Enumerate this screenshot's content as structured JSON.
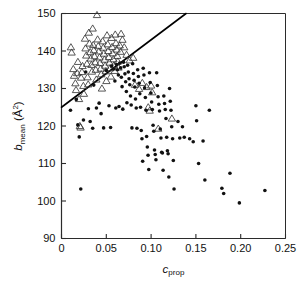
{
  "figure": {
    "background_color": "#ffffff",
    "foreground_color": "#000000"
  },
  "axes": {
    "x_title_main": "c",
    "x_title_sub": "prop",
    "y_title_main": "b",
    "y_title_sub": "mean",
    "y_title_unit_open": " (Å",
    "y_title_unit_sup": "2",
    "y_title_unit_close": ")",
    "x_ticklabels": [
      "0",
      "0.05",
      "0.10",
      "0.15",
      "0.20",
      "0.25"
    ],
    "y_ticklabels": [
      "90",
      "100",
      "110",
      "120",
      "130",
      "140",
      "150"
    ]
  },
  "chart_data": {
    "type": "scatter",
    "title": "",
    "xlabel": "c_prop",
    "ylabel": "b_mean (Å^2)",
    "xlim": [
      0,
      0.25
    ],
    "ylim": [
      90,
      150
    ],
    "xticks": [
      0,
      0.05,
      0.1,
      0.15,
      0.2,
      0.25
    ],
    "yticks": [
      90,
      100,
      110,
      120,
      130,
      140,
      150
    ],
    "grid": false,
    "legend": "none",
    "annotations": [],
    "trendline": {
      "name": "diagonal reference line",
      "x": [
        0.0,
        0.139
      ],
      "y": [
        125.0,
        150.0
      ],
      "color": "#000000",
      "width": 1.6
    },
    "series": [
      {
        "name": "open triangles",
        "marker": "triangle-up-open",
        "color": "#3a3a3a",
        "size": 4.6,
        "points": [
          [
            0.0105,
            141.0
          ],
          [
            0.0113,
            139.6
          ],
          [
            0.0132,
            135.2
          ],
          [
            0.014,
            133.4
          ],
          [
            0.0155,
            131.4
          ],
          [
            0.0162,
            129.6
          ],
          [
            0.0175,
            134.1
          ],
          [
            0.0183,
            137.1
          ],
          [
            0.0196,
            127.2
          ],
          [
            0.0205,
            120.0
          ],
          [
            0.0213,
            119.6
          ],
          [
            0.0219,
            132.9
          ],
          [
            0.0228,
            134.4
          ],
          [
            0.0235,
            136.0
          ],
          [
            0.0244,
            130.7
          ],
          [
            0.025,
            128.6
          ],
          [
            0.0262,
            143.3
          ],
          [
            0.0268,
            140.7
          ],
          [
            0.0276,
            138.8
          ],
          [
            0.0284,
            136.6
          ],
          [
            0.0291,
            133.0
          ],
          [
            0.0298,
            131.1
          ],
          [
            0.0305,
            144.9
          ],
          [
            0.0312,
            142.0
          ],
          [
            0.032,
            139.7
          ],
          [
            0.0327,
            138.0
          ],
          [
            0.0334,
            136.3
          ],
          [
            0.034,
            134.5
          ],
          [
            0.0348,
            146.0
          ],
          [
            0.0354,
            141.6
          ],
          [
            0.0361,
            140.2
          ],
          [
            0.0368,
            138.6
          ],
          [
            0.0376,
            137.0
          ],
          [
            0.0382,
            135.0
          ],
          [
            0.0389,
            132.4
          ],
          [
            0.0396,
            149.6
          ],
          [
            0.0403,
            143.1
          ],
          [
            0.041,
            141.3
          ],
          [
            0.0417,
            139.9
          ],
          [
            0.0424,
            138.3
          ],
          [
            0.043,
            136.8
          ],
          [
            0.0437,
            135.3
          ],
          [
            0.0444,
            133.8
          ],
          [
            0.0451,
            130.0
          ],
          [
            0.0459,
            142.6
          ],
          [
            0.0466,
            140.9
          ],
          [
            0.0472,
            139.3
          ],
          [
            0.048,
            137.7
          ],
          [
            0.0487,
            136.1
          ],
          [
            0.0494,
            134.6
          ],
          [
            0.0501,
            132.0
          ],
          [
            0.0508,
            144.2
          ],
          [
            0.0516,
            141.8
          ],
          [
            0.0522,
            140.0
          ],
          [
            0.0529,
            138.4
          ],
          [
            0.0536,
            136.9
          ],
          [
            0.0543,
            135.4
          ],
          [
            0.0551,
            133.2
          ],
          [
            0.0558,
            143.5
          ],
          [
            0.0565,
            141.1
          ],
          [
            0.0572,
            139.4
          ],
          [
            0.0579,
            137.8
          ],
          [
            0.0586,
            136.2
          ],
          [
            0.0594,
            134.7
          ],
          [
            0.06,
            144.4
          ],
          [
            0.0608,
            142.1
          ],
          [
            0.0615,
            140.4
          ],
          [
            0.0622,
            138.7
          ],
          [
            0.0629,
            137.2
          ],
          [
            0.0636,
            135.6
          ],
          [
            0.065,
            141.5
          ],
          [
            0.0658,
            139.8
          ],
          [
            0.0665,
            144.6
          ],
          [
            0.068,
            143.0
          ],
          [
            0.07,
            141.0
          ],
          [
            0.0726,
            139.0
          ],
          [
            0.076,
            137.5
          ],
          [
            0.08,
            138.2
          ],
          [
            0.082,
            131.0
          ],
          [
            0.0866,
            129.9
          ],
          [
            0.0902,
            131.5
          ],
          [
            0.095,
            130.4
          ],
          [
            0.0968,
            125.0
          ],
          [
            0.0984,
            124.1
          ],
          [
            0.1,
            130.8
          ],
          [
            0.1012,
            129.0
          ],
          [
            0.108,
            119.3
          ],
          [
            0.1232,
            122.0
          ]
        ]
      },
      {
        "name": "filled circles",
        "marker": "circle-filled",
        "color": "#111111",
        "size": 3.6,
        "points": [
          [
            0.01,
            124.2
          ],
          [
            0.0165,
            127.1
          ],
          [
            0.0182,
            120.3
          ],
          [
            0.0198,
            117.1
          ],
          [
            0.0215,
            103.2
          ],
          [
            0.0245,
            121.6
          ],
          [
            0.027,
            134.4
          ],
          [
            0.03,
            124.6
          ],
          [
            0.032,
            121.2
          ],
          [
            0.0348,
            119.4
          ],
          [
            0.036,
            130.9
          ],
          [
            0.039,
            124.8
          ],
          [
            0.042,
            126.1
          ],
          [
            0.0442,
            123.3
          ],
          [
            0.047,
            119.5
          ],
          [
            0.05,
            134.8
          ],
          [
            0.053,
            125.4
          ],
          [
            0.0548,
            119.6
          ],
          [
            0.056,
            136.0
          ],
          [
            0.058,
            135.2
          ],
          [
            0.0596,
            132.0
          ],
          [
            0.0606,
            124.8
          ],
          [
            0.0615,
            136.4
          ],
          [
            0.0625,
            135.0
          ],
          [
            0.0635,
            133.6
          ],
          [
            0.0642,
            125.2
          ],
          [
            0.065,
            136.8
          ],
          [
            0.066,
            135.5
          ],
          [
            0.0668,
            133.0
          ],
          [
            0.0676,
            130.5
          ],
          [
            0.0684,
            124.5
          ],
          [
            0.0692,
            137.0
          ],
          [
            0.07,
            135.8
          ],
          [
            0.0708,
            133.9
          ],
          [
            0.0716,
            131.8
          ],
          [
            0.0724,
            129.2
          ],
          [
            0.073,
            126.2
          ],
          [
            0.0738,
            136.2
          ],
          [
            0.0746,
            134.4
          ],
          [
            0.0754,
            132.6
          ],
          [
            0.0762,
            131.0
          ],
          [
            0.077,
            128.0
          ],
          [
            0.0778,
            125.6
          ],
          [
            0.0786,
            119.5
          ],
          [
            0.0794,
            136.6
          ],
          [
            0.0802,
            134.0
          ],
          [
            0.081,
            132.2
          ],
          [
            0.0818,
            130.4
          ],
          [
            0.0826,
            127.2
          ],
          [
            0.0834,
            124.8
          ],
          [
            0.0842,
            119.4
          ],
          [
            0.085,
            135.0
          ],
          [
            0.0858,
            133.2
          ],
          [
            0.0866,
            131.4
          ],
          [
            0.0874,
            128.6
          ],
          [
            0.0882,
            125.0
          ],
          [
            0.089,
            118.8
          ],
          [
            0.0898,
            116.6
          ],
          [
            0.0906,
            110.6
          ],
          [
            0.0912,
            135.4
          ],
          [
            0.092,
            133.6
          ],
          [
            0.0928,
            130.2
          ],
          [
            0.0936,
            127.6
          ],
          [
            0.0944,
            124.2
          ],
          [
            0.095,
            117.2
          ],
          [
            0.0958,
            114.4
          ],
          [
            0.0966,
            112.2
          ],
          [
            0.0974,
            108.4
          ],
          [
            0.0982,
            134.2
          ],
          [
            0.099,
            131.6
          ],
          [
            0.0998,
            128.8
          ],
          [
            0.1006,
            126.4
          ],
          [
            0.1014,
            124.4
          ],
          [
            0.1022,
            120.2
          ],
          [
            0.103,
            118.6
          ],
          [
            0.1038,
            113.6
          ],
          [
            0.1046,
            112.4
          ],
          [
            0.1054,
            111.0
          ],
          [
            0.1062,
            134.2
          ],
          [
            0.107,
            130.8
          ],
          [
            0.1078,
            127.8
          ],
          [
            0.1086,
            125.8
          ],
          [
            0.1094,
            124.0
          ],
          [
            0.1102,
            119.2
          ],
          [
            0.111,
            116.8
          ],
          [
            0.1118,
            113.0
          ],
          [
            0.1126,
            112.8
          ],
          [
            0.1134,
            108.2
          ],
          [
            0.1142,
            128.0
          ],
          [
            0.115,
            126.0
          ],
          [
            0.1158,
            124.4
          ],
          [
            0.1166,
            122.0
          ],
          [
            0.1174,
            117.0
          ],
          [
            0.1182,
            113.4
          ],
          [
            0.119,
            112.6
          ],
          [
            0.1198,
            106.4
          ],
          [
            0.1206,
            130.0
          ],
          [
            0.1214,
            126.6
          ],
          [
            0.1222,
            124.2
          ],
          [
            0.123,
            119.8
          ],
          [
            0.124,
            116.6
          ],
          [
            0.1248,
            110.8
          ],
          [
            0.1256,
            103.2
          ],
          [
            0.13,
            121.2
          ],
          [
            0.132,
            116.8
          ],
          [
            0.135,
            119.8
          ],
          [
            0.137,
            117.0
          ],
          [
            0.143,
            116.6
          ],
          [
            0.147,
            115.8
          ],
          [
            0.15,
            125.4
          ],
          [
            0.1508,
            121.4
          ],
          [
            0.153,
            110.0
          ],
          [
            0.158,
            116.0
          ],
          [
            0.16,
            105.6
          ],
          [
            0.165,
            124.2
          ],
          [
            0.179,
            103.4
          ],
          [
            0.181,
            102.0
          ],
          [
            0.188,
            107.4
          ],
          [
            0.1985,
            99.5
          ],
          [
            0.227,
            102.8
          ]
        ]
      }
    ]
  }
}
